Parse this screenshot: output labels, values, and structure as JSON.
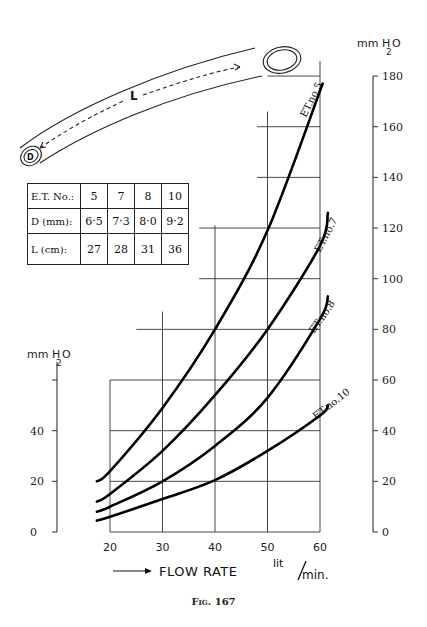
{
  "figure": {
    "caption": "Fig. 167"
  },
  "tube_diagram": {
    "length_label": "L",
    "diameter_label": "D"
  },
  "table": {
    "rows": [
      {
        "label": "E.T. No.:",
        "values": [
          "5",
          "7",
          "8",
          "10"
        ]
      },
      {
        "label": "D (mm):",
        "values": [
          "6·5",
          "7·3",
          "8·0",
          "9·2"
        ]
      },
      {
        "label": "L (cm):",
        "values": [
          "27",
          "28",
          "31",
          "36"
        ]
      }
    ]
  },
  "axes": {
    "x_label": "FLOW RATE",
    "x_unit_top": "lit",
    "x_unit_bottom": "min.",
    "y_label_right": "mm H2O",
    "y_label_left": "mm H2O",
    "x_ticks": [
      "20",
      "30",
      "40",
      "50",
      "60"
    ],
    "right_ticks": [
      "0",
      "20",
      "40",
      "60",
      "80",
      "100",
      "120",
      "140",
      "160",
      "180"
    ],
    "left_ticks": [
      "0",
      "20",
      "40"
    ]
  },
  "chart_data": {
    "type": "line",
    "title": "",
    "caption": "Fig. 167",
    "xlabel": "FLOW RATE lit/min.",
    "ylabel": "mm H2O",
    "xlim": [
      17,
      62
    ],
    "ylim": [
      0,
      180
    ],
    "x_ticks": [
      20,
      30,
      40,
      50,
      60
    ],
    "y_ticks_right": [
      0,
      20,
      40,
      60,
      80,
      100,
      120,
      140,
      160,
      180
    ],
    "y_ticks_left": [
      0,
      20,
      40
    ],
    "grid": true,
    "grid_style": "stepped",
    "legend": "inline labels on curves",
    "series": [
      {
        "name": "ET.no.5",
        "x": [
          17.5,
          20,
          30,
          40,
          50,
          60.5
        ],
        "values": [
          20,
          24,
          49,
          80,
          119,
          177
        ]
      },
      {
        "name": "ET.no.7",
        "x": [
          17.5,
          20,
          30,
          40,
          50,
          60,
          61.5
        ],
        "values": [
          12,
          15,
          32,
          54,
          80,
          113,
          126
        ]
      },
      {
        "name": "ET.no.8",
        "x": [
          17.5,
          20,
          30,
          40,
          50,
          60,
          61.5
        ],
        "values": [
          8,
          10,
          20,
          34,
          53,
          84,
          93
        ]
      },
      {
        "name": "ET.no.10",
        "x": [
          17.5,
          20,
          30,
          40,
          50,
          60,
          61.5
        ],
        "values": [
          4.5,
          6,
          13,
          20.5,
          32,
          46,
          50
        ]
      }
    ]
  },
  "colors": {
    "ink": "#111111",
    "background": "#ffffff"
  }
}
